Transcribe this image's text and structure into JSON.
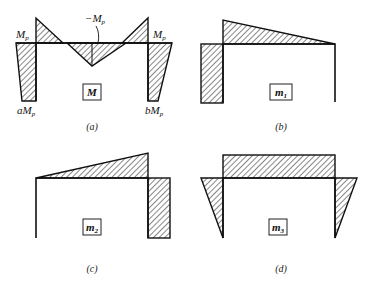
{
  "panels": {
    "a": {
      "caption": "(a)",
      "box_label": "M",
      "labels": {
        "left_top": "M",
        "left_top_sub": "p",
        "right_top": "M",
        "right_top_sub": "p",
        "mid": "−M",
        "mid_sub": "p",
        "left_bottom": "aM",
        "left_bottom_sub": "p",
        "right_bottom": "bM",
        "right_bottom_sub": "p"
      }
    },
    "b": {
      "caption": "(b)",
      "box_label": "m",
      "box_sub": "1"
    },
    "c": {
      "caption": "(c)",
      "box_label": "m",
      "box_sub": "2"
    },
    "d": {
      "caption": "(d)",
      "box_label": "m",
      "box_sub": "3"
    }
  }
}
